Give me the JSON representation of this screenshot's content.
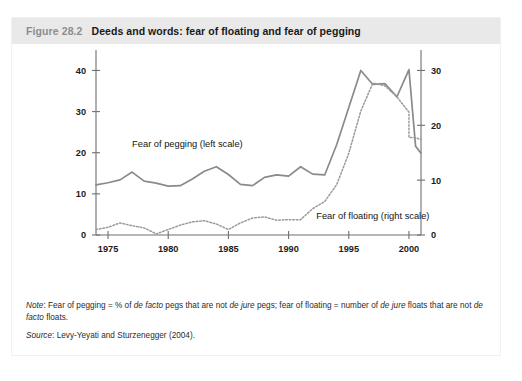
{
  "figure": {
    "number": "Figure 28.2",
    "title": "Deeds and words: fear of floating and fear of pegging"
  },
  "notes": {
    "note_label": "Note",
    "note_text": ": Fear of pegging = % of de facto pegs that are not de jure pegs; fear of floating = number of de jure floats that are not de facto floats.",
    "source_label": "Source",
    "source_text": ": Levy-Yeyati and Sturzenegger (2004)."
  },
  "chart_data": {
    "type": "line",
    "title": "Deeds and words: fear of floating and fear of pegging",
    "xlabel": "",
    "ylabel": "",
    "grid": false,
    "legend_position": "inline-annotation",
    "x": [
      1974,
      1975,
      1976,
      1977,
      1978,
      1979,
      1980,
      1981,
      1982,
      1983,
      1984,
      1985,
      1986,
      1987,
      1988,
      1989,
      1990,
      1991,
      1992,
      1993,
      1994,
      1995,
      1996,
      1997,
      1998,
      1999,
      2000,
      2001
    ],
    "xlim": [
      1974,
      2001
    ],
    "xticks": [
      1975,
      1980,
      1985,
      1990,
      1995,
      2000
    ],
    "xticklabels": [
      "1975",
      "1980",
      "1985",
      "1990",
      "1995",
      "2000"
    ],
    "left_axis": {
      "label": "Fear of pegging (left scale)",
      "ylim": [
        0,
        44
      ],
      "yticks": [
        0,
        10,
        20,
        30,
        40
      ],
      "yticklabels": [
        "0",
        "10",
        "20",
        "30",
        "40"
      ]
    },
    "right_axis": {
      "label": "Fear of floating (right scale)",
      "ylim": [
        0,
        33
      ],
      "yticks": [
        0,
        10,
        20,
        30
      ],
      "yticklabels": [
        "0",
        "10",
        "20",
        "30"
      ]
    },
    "series": [
      {
        "name": "Fear of pegging (left scale)",
        "axis": "left",
        "style": "solid",
        "color": "#8a8a8a",
        "label_x": 1977.0,
        "label_y": 21.5,
        "values": [
          12.2,
          12.7,
          13.4,
          15.3,
          13.1,
          12.6,
          11.9,
          12.0,
          13.6,
          15.5,
          16.6,
          14.7,
          12.3,
          12.0,
          14.0,
          14.6,
          14.3,
          16.6,
          14.8,
          14.6,
          22.0,
          31.0,
          40.0,
          36.6,
          36.8,
          33.6,
          40.2,
          30.3
        ]
      },
      {
        "name": "Fear of floating (right scale)",
        "axis": "right",
        "style": "dotted",
        "color": "#9a9a9a",
        "label_x": 1992.3,
        "label_y": 3.0,
        "values": [
          1.0,
          1.4,
          2.2,
          1.7,
          1.3,
          0.2,
          1.0,
          1.8,
          2.4,
          2.6,
          2.0,
          1.0,
          2.2,
          3.1,
          3.3,
          2.7,
          2.8,
          2.8,
          4.8,
          6.1,
          9.2,
          14.9,
          22.6,
          27.7,
          27.2,
          25.2,
          22.4,
          17.5
        ]
      }
    ],
    "final_segment": {
      "note": "solid series drops to 21.5 (left) at 2000.6 before final point",
      "solid_tail": [
        [
          2000.0,
          40.2
        ],
        [
          2000.55,
          21.6
        ],
        [
          2001.0,
          19.9
        ]
      ],
      "dotted_tail": [
        [
          2000.0,
          17.8
        ],
        [
          2000.6,
          17.7
        ],
        [
          2001.0,
          17.4
        ]
      ]
    }
  }
}
